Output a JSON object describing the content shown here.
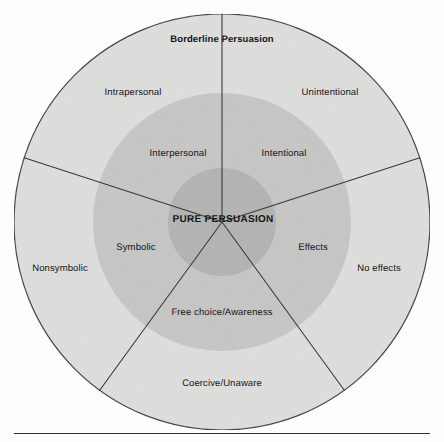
{
  "figure": {
    "title_label": "Borderline Persuasion",
    "center_label": "PURE PERSUASION",
    "rings": [
      {
        "name": "outer",
        "label": "Borderline Persuasion zone",
        "radius": 208,
        "fill": "#dededd"
      },
      {
        "name": "middle",
        "label": "Intermediate persuasion zone",
        "radius": 129,
        "fill": "#c6c6c5"
      },
      {
        "name": "inner",
        "label": "Pure persuasion core",
        "radius": 54,
        "fill": "#b3b3b2"
      }
    ],
    "center": {
      "x": 222,
      "y": 222
    },
    "sectors": [
      {
        "name": "intrapersonal-interpersonal",
        "outer_label": "Intrapersonal",
        "middle_label": "Interpersonal"
      },
      {
        "name": "intentionality",
        "outer_label": "Unintentional",
        "middle_label": "Intentional"
      },
      {
        "name": "effects",
        "outer_label": "No effects",
        "middle_label": "Effects"
      },
      {
        "name": "coercion",
        "outer_label": "Coercive/Unaware",
        "middle_label": "Free choice/Awareness"
      },
      {
        "name": "symbolism",
        "outer_label": "Nonsymbolic",
        "middle_label": "Symbolic"
      }
    ],
    "colors": {
      "outer_ring": "#dededd",
      "middle_ring": "#c6c6c5",
      "inner_ring": "#b3b3b2",
      "stroke": "#3a3a3c",
      "text": "#15161a",
      "page_background": "#fdfdfd",
      "rule": "#2f3034"
    },
    "labels": {
      "title": "Borderline Persuasion",
      "intrapersonal": "Intrapersonal",
      "unintentional": "Unintentional",
      "interpersonal": "Interpersonal",
      "intentional": "Intentional",
      "pure_persuasion": "PURE PERSUASION",
      "symbolic": "Symbolic",
      "effects": "Effects",
      "nonsymbolic": "Nonsymbolic",
      "no_effects": "No effects",
      "free_choice": "Free choice/Awareness",
      "coercive": "Coercive/Unaware"
    }
  }
}
